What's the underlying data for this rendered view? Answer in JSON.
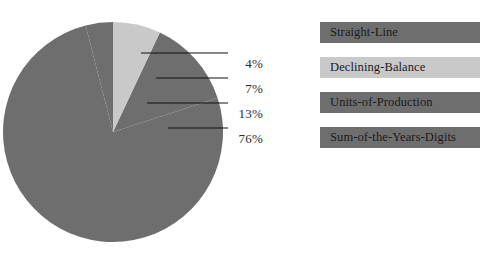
{
  "chart_data": {
    "type": "pie",
    "title": "",
    "categories": [
      "Straight-Line",
      "Declining-Balance",
      "Units-of-Production",
      "Sum-of-the-Years-Digits"
    ],
    "values": [
      4,
      7,
      13,
      76
    ],
    "value_labels": [
      "4%",
      "7%",
      "13%",
      "76%"
    ],
    "colors": [
      "#6e6e6e",
      "#c9c9c9",
      "#6e6e6e",
      "#6e6e6e"
    ],
    "legend_position": "right",
    "grid": false,
    "xlabel": "",
    "ylabel": ""
  },
  "pie": {
    "slices": [
      {
        "name": "Straight-Line",
        "pct_label": "4%",
        "value": 4,
        "color": "#6e6e6e"
      },
      {
        "name": "Declining-Balance",
        "pct_label": "7%",
        "value": 7,
        "color": "#c9c9c9"
      },
      {
        "name": "Units-of-Production",
        "pct_label": "13%",
        "value": 13,
        "color": "#6e6e6e"
      },
      {
        "name": "Sum-of-the-Years-Digits",
        "pct_label": "76%",
        "value": 76,
        "color": "#6e6e6e"
      }
    ]
  },
  "legend": {
    "items": [
      {
        "label": "Straight-Line",
        "color": "#6e6e6e"
      },
      {
        "label": "Declining-Balance",
        "color": "#c9c9c9"
      },
      {
        "label": "Units-of-Production",
        "color": "#6e6e6e"
      },
      {
        "label": "Sum-of-the-Years-Digits",
        "color": "#6e6e6e"
      }
    ]
  }
}
